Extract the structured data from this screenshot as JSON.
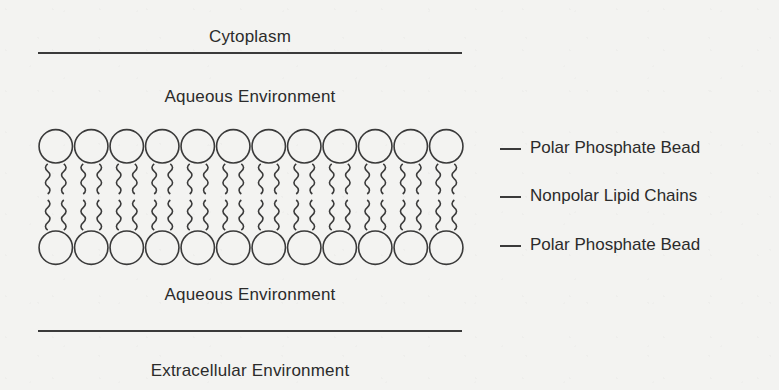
{
  "diagram": {
    "background_color": "#f3f3f1",
    "ink_color": "#3a3a3a",
    "regions": {
      "top_region_label": "Cytoplasm",
      "top_aqueous_label": "Aqueous Environment",
      "bottom_aqueous_label": "Aqueous Environment",
      "bottom_region_label": "Extracellular Environment"
    },
    "callouts": [
      {
        "label": "Polar Phosphate Bead"
      },
      {
        "label": "Nonpolar Lipid Chains"
      },
      {
        "label": "Polar Phosphate Bead"
      }
    ],
    "bilayer": {
      "molecules_per_leaflet": 12,
      "leaflets": 2,
      "head_shape": "circle",
      "head_diameter_px": 35,
      "tails_per_head": 2,
      "tail_style": "wavy"
    }
  }
}
